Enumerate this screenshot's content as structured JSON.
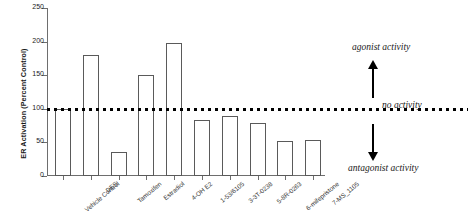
{
  "chart_data": {
    "type": "bar",
    "title": "",
    "xlabel": "",
    "ylabel": "ER Activation (Percent Control)",
    "ylim": [
      0,
      250
    ],
    "yticks": [
      0,
      50,
      100,
      150,
      200,
      250
    ],
    "grid": false,
    "legend": null,
    "categories": [
      "Vehicle Control",
      "DES",
      "Tamoxifen",
      "Estradiol",
      "4-OH E2",
      "1-53/6105",
      "3-3T-0238",
      "5-8R-0263",
      "6-mifepristone",
      "7-MS_1105"
    ],
    "values": [
      100,
      180,
      36,
      151,
      198,
      83,
      90,
      79,
      52,
      54
    ],
    "reference_line": {
      "value": 100,
      "label": "no activity",
      "style": "dotted"
    },
    "annotations": [
      {
        "text": "agonist activity",
        "position": "upper-right"
      },
      {
        "text": "no activity",
        "position": "middle-right"
      },
      {
        "text": "antagonist activity",
        "position": "lower-right"
      }
    ]
  },
  "axes": {
    "y_title": "ER Activation (Percent Control)",
    "y_tick_labels": [
      "250",
      "200",
      "150",
      "100",
      "50",
      "0"
    ]
  },
  "annotations": {
    "agonist": "agonist activity",
    "no_activity": "no activity",
    "antagonist": "antagonist activity"
  }
}
